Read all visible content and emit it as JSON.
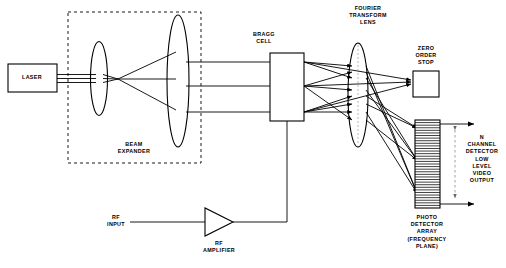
{
  "diagram": {
    "background_color": "#ffffff",
    "stroke_color": "#000000",
    "labels": {
      "laser": "LASER",
      "beam_expander": "BEAM\nEXPANDER",
      "bragg_cell": "BRAGG\nCELL",
      "fourier_transform_lens": "FOURIER\nTRANSFORM\nLENS",
      "zero_order_stop": "ZERO\nORDER\nSTOP",
      "photo_detector_array": "PHOTO\nDETECTOR\nARRAY\n(FREQUENCY\nPLANE)",
      "rf_input": "RF\nINPUT",
      "rf_amplifier": "RF\nAMPLIFIER",
      "video_output": "N\nCHANNEL\nDETECTOR\nLOW\nLEVEL\nVIDEO\nOUTPUT"
    },
    "components": [
      {
        "name": "laser-source",
        "type": "box",
        "label": "LASER"
      },
      {
        "name": "beam-expander-group",
        "type": "dashed-enclosure",
        "label": "BEAM EXPANDER"
      },
      {
        "name": "expander-input-lens",
        "type": "lens"
      },
      {
        "name": "expander-output-lens",
        "type": "lens"
      },
      {
        "name": "bragg-cell",
        "type": "box",
        "label": "BRAGG CELL"
      },
      {
        "name": "fourier-transform-lens",
        "type": "lens",
        "label": "FOURIER TRANSFORM LENS"
      },
      {
        "name": "zero-order-stop",
        "type": "box",
        "label": "ZERO ORDER STOP"
      },
      {
        "name": "photo-detector-array",
        "type": "striped-box",
        "label": "PHOTO DETECTOR ARRAY (FREQUENCY PLANE)"
      },
      {
        "name": "rf-amplifier",
        "type": "triangle",
        "label": "RF AMPLIFIER"
      },
      {
        "name": "rf-input-line",
        "type": "line",
        "label": "RF INPUT"
      }
    ],
    "detector_stripe_count": 34
  }
}
